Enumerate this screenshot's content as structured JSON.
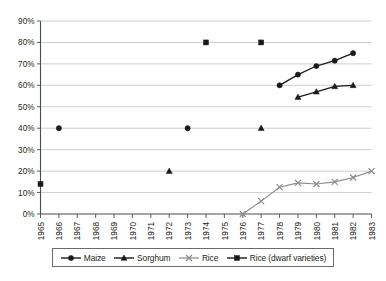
{
  "chart_data": {
    "type": "line",
    "title": "",
    "xlabel": "",
    "ylabel": "",
    "x": [
      1965,
      1966,
      1967,
      1968,
      1969,
      1970,
      1971,
      1972,
      1973,
      1974,
      1975,
      1976,
      1977,
      1978,
      1979,
      1980,
      1981,
      1982,
      1983
    ],
    "xtick_labels": [
      "1965",
      "1966",
      "1967",
      "1968",
      "1969",
      "1970",
      "1971",
      "1972",
      "1973",
      "1974",
      "1975",
      "1976",
      "1977",
      "1978",
      "1979",
      "1980",
      "1981",
      "1982",
      "1983"
    ],
    "ytick_labels": [
      "0%",
      "10%",
      "20%",
      "30%",
      "40%",
      "50%",
      "60%",
      "70%",
      "80%",
      "90%"
    ],
    "ytick_values": [
      0,
      10,
      20,
      30,
      40,
      50,
      60,
      70,
      80,
      90
    ],
    "ylim": [
      0,
      90
    ],
    "xlim": [
      1965,
      1983
    ],
    "grid": "horizontal",
    "legend_position": "bottom",
    "series": [
      {
        "name": "Maize",
        "marker": "circle",
        "color": "#1a1a1a",
        "points": [
          {
            "x": 1966,
            "y": 40
          },
          {
            "x": 1973,
            "y": 40
          },
          {
            "x": 1978,
            "y": 60
          },
          {
            "x": 1979,
            "y": 65
          },
          {
            "x": 1980,
            "y": 69
          },
          {
            "x": 1981,
            "y": 71.5
          },
          {
            "x": 1982,
            "y": 75
          }
        ],
        "connected_from": 1978
      },
      {
        "name": "Sorghum",
        "marker": "triangle",
        "color": "#1a1a1a",
        "points": [
          {
            "x": 1972,
            "y": 20
          },
          {
            "x": 1977,
            "y": 40
          },
          {
            "x": 1979,
            "y": 54.5
          },
          {
            "x": 1980,
            "y": 57
          },
          {
            "x": 1981,
            "y": 59.5
          },
          {
            "x": 1982,
            "y": 60
          }
        ],
        "connected_from": 1979
      },
      {
        "name": "Rice",
        "marker": "x",
        "color": "#8c8c8c",
        "points": [
          {
            "x": 1976,
            "y": 0
          },
          {
            "x": 1977,
            "y": 6
          },
          {
            "x": 1978,
            "y": 12.5
          },
          {
            "x": 1979,
            "y": 14.5
          },
          {
            "x": 1980,
            "y": 14
          },
          {
            "x": 1981,
            "y": 15
          },
          {
            "x": 1982,
            "y": 17
          },
          {
            "x": 1983,
            "y": 20
          }
        ],
        "connected_from": 1976
      },
      {
        "name": "Rice (dwarf varieties)",
        "marker": "square",
        "color": "#1a1a1a",
        "points": [
          {
            "x": 1965,
            "y": 14
          },
          {
            "x": 1974,
            "y": 80
          },
          {
            "x": 1977,
            "y": 80
          }
        ],
        "connected_from": null
      }
    ]
  },
  "legend": {
    "items": [
      {
        "label": "Maize",
        "marker": "circle"
      },
      {
        "label": "Sorghum",
        "marker": "triangle"
      },
      {
        "label": "Rice",
        "marker": "x"
      },
      {
        "label": "Rice (dwarf varieties)",
        "marker": "square"
      }
    ]
  }
}
